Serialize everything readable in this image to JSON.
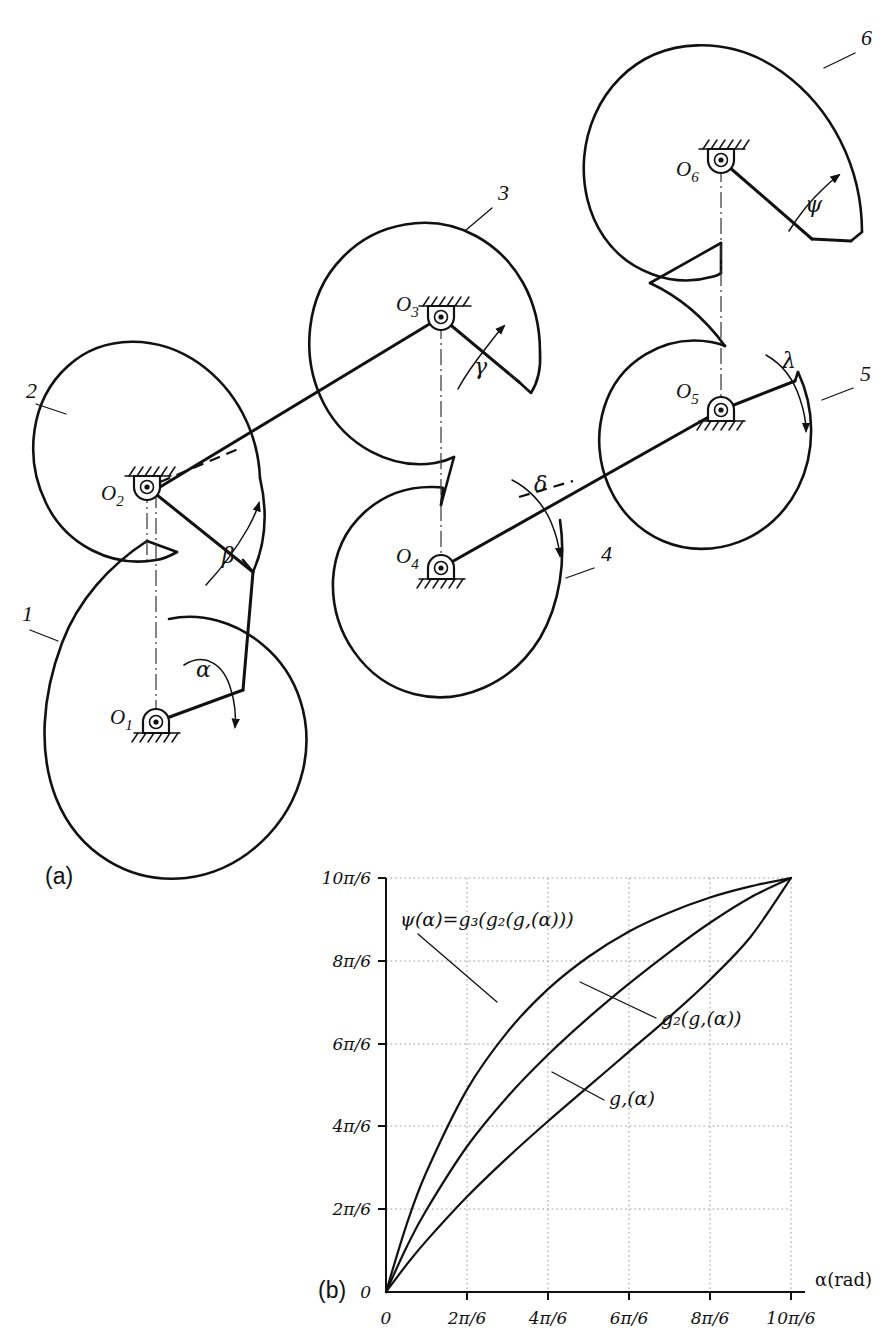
{
  "figure": {
    "parts": [
      {
        "key": "a",
        "label": "(a)",
        "caption_x": 45,
        "caption_y": 884
      },
      {
        "key": "b",
        "label": "(b)",
        "caption_x": 318,
        "caption_y": 1298
      }
    ]
  },
  "mechanism": {
    "title_note": "six-link cam chain",
    "links": [
      {
        "id": "1",
        "label": "1",
        "label_x": 22,
        "label_y": 621,
        "leader": "30,630 58,641"
      },
      {
        "id": "2",
        "label": "2",
        "label_x": 26,
        "label_y": 398,
        "leader": "36,404 66,414"
      },
      {
        "id": "3",
        "label": "3",
        "label_x": 498,
        "label_y": 200,
        "leader": "492,208 466,230"
      },
      {
        "id": "4",
        "label": "4",
        "label_x": 601,
        "label_y": 561,
        "leader": "594,568 566,578"
      },
      {
        "id": "5",
        "label": "5",
        "label_x": 860,
        "label_y": 381,
        "leader": "853,388 822,400"
      },
      {
        "id": "6",
        "label": "6",
        "label_x": 861,
        "label_y": 45,
        "leader": "855,53 824,68"
      }
    ],
    "joints": [
      {
        "id": "O1",
        "label": "O",
        "sub": "1",
        "cx": 156,
        "cy": 722,
        "label_x": 110,
        "label_y": 724,
        "ground": "below"
      },
      {
        "id": "O2",
        "label": "O",
        "sub": "2",
        "cx": 147,
        "cy": 487,
        "label_x": 101,
        "label_y": 500,
        "ground": "above"
      },
      {
        "id": "O3",
        "label": "O",
        "sub": "3",
        "cx": 441,
        "cy": 317,
        "label_x": 396,
        "label_y": 311,
        "ground": "above"
      },
      {
        "id": "O4",
        "label": "O",
        "sub": "4",
        "cx": 441,
        "cy": 568,
        "label_x": 396,
        "label_y": 563,
        "ground": "below"
      },
      {
        "id": "O5",
        "label": "O",
        "sub": "5",
        "cx": 721,
        "cy": 410,
        "label_x": 676,
        "label_y": 398,
        "ground": "below"
      },
      {
        "id": "O6",
        "label": "O",
        "sub": "6",
        "cx": 721,
        "cy": 160,
        "label_x": 676,
        "label_y": 176,
        "ground": "above"
      }
    ],
    "angles": [
      {
        "id": "alpha",
        "symbol": "α",
        "x": 196,
        "y": 677,
        "direction": "cw"
      },
      {
        "id": "beta",
        "symbol": "β",
        "x": 222,
        "y": 563,
        "direction": "ccw"
      },
      {
        "id": "gamma",
        "symbol": "γ",
        "x": 474,
        "y": 374,
        "direction": "ccw"
      },
      {
        "id": "delta",
        "symbol": "δ",
        "x": 534,
        "y": 492,
        "direction": "cw"
      },
      {
        "id": "lambda",
        "symbol": "λ",
        "x": 782,
        "y": 368,
        "direction": "cw"
      },
      {
        "id": "psi",
        "symbol": "ψ",
        "x": 805,
        "y": 212,
        "direction": "ccw"
      }
    ]
  },
  "chart_data": {
    "type": "line",
    "title": "",
    "xlabel": "α(rad)",
    "ylabel": "",
    "xlim": [
      0,
      5.23599
    ],
    "ylim": [
      0,
      5.23599
    ],
    "grid": true,
    "legend": "inline-annotations",
    "x_ticks": [
      "0",
      "2π/6",
      "4π/6",
      "6π/6",
      "8π/6",
      "10π/6"
    ],
    "x_tick_values": [
      0,
      1.0472,
      2.0944,
      3.14159,
      4.18879,
      5.23599
    ],
    "y_ticks": [
      "0",
      "2π/6",
      "4π/6",
      "6π/6",
      "8π/6",
      "10π/6"
    ],
    "y_tick_values": [
      0,
      1.0472,
      2.0944,
      3.14159,
      4.18879,
      5.23599
    ],
    "x_unit_note": "α expressed in multiples of π/6",
    "series": [
      {
        "name": "g₁(α)",
        "label": "g,(α)",
        "annotation_x": 609,
        "annotation_y": 1105,
        "leader": "604,1100 552,1072",
        "x": [
          0,
          0.262,
          0.524,
          1.047,
          1.571,
          2.094,
          2.618,
          3.142,
          3.665,
          4.189,
          4.712,
          5.236
        ],
        "y": [
          0,
          0.34,
          0.65,
          1.205,
          1.7,
          2.16,
          2.6,
          3.04,
          3.48,
          3.95,
          4.49,
          5.236
        ]
      },
      {
        "name": "g₂(g₁(α))",
        "label": "g₂(g,(α))",
        "annotation_x": 661,
        "annotation_y": 1025,
        "leader": "656,1018 580,982",
        "x": [
          0,
          0.262,
          0.524,
          1.047,
          1.571,
          2.094,
          2.618,
          3.142,
          3.665,
          4.189,
          4.712,
          5.236
        ],
        "y": [
          0,
          0.56,
          1.04,
          1.84,
          2.47,
          3.0,
          3.47,
          3.9,
          4.3,
          4.67,
          4.99,
          5.236
        ]
      },
      {
        "name": "ψ(α) = g₃(g₂(g₁(α)))",
        "label": "ψ(α)=g₃(g₂(g,(α)))",
        "annotation_x": 400,
        "annotation_y": 926,
        "leader": "418,934 497,1002",
        "x": [
          0,
          0.262,
          0.524,
          1.047,
          1.571,
          2.094,
          2.618,
          3.142,
          3.665,
          4.189,
          4.712,
          5.236
        ],
        "y": [
          0,
          0.84,
          1.52,
          2.56,
          3.29,
          3.83,
          4.24,
          4.56,
          4.8,
          4.99,
          5.13,
          5.236
        ]
      }
    ],
    "axis_pixels": {
      "x0": 386,
      "y0": 1292,
      "x1": 791,
      "y1": 878
    }
  }
}
